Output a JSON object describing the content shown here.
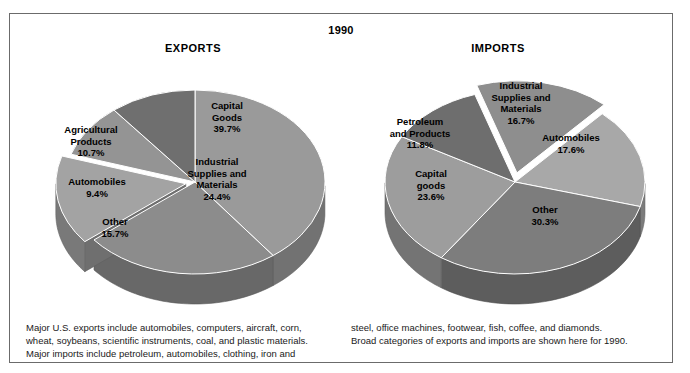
{
  "figure": {
    "year_title": "1990",
    "headings": {
      "exports": "EXPORTS",
      "imports": "IMPORTS"
    },
    "border_color": "#6b6b6b",
    "background": "#ffffff"
  },
  "caption": {
    "left_lines": [
      "Major U.S. exports include automobiles, computers, aircraft, corn,",
      "wheat, soybeans, scientific instruments, coal, and plastic materials.",
      "Major imports include petroleum, automobiles, clothing, iron and"
    ],
    "right_lines": [
      "steel, office machines, footwear, fish, coffee, and diamonds.",
      "Broad categories of exports and imports are shown here for 1990."
    ]
  },
  "chart_data": [
    {
      "type": "pie",
      "title": "EXPORTS",
      "subtitle": "1990",
      "xlabel": "",
      "ylabel": "",
      "grid": false,
      "legend": "none",
      "style": "3d-exploded",
      "units": "percent",
      "categories": [
        "Capital Goods",
        "Industrial Supplies and Materials",
        "Other",
        "Automobiles",
        "Agricultural Products"
      ],
      "values": [
        39.7,
        24.4,
        15.7,
        9.4,
        10.7
      ],
      "labels": [
        {
          "name": "Capital Goods",
          "name_lines": [
            "Capital",
            "Goods"
          ],
          "value": 39.7,
          "pct_text": "39.7%",
          "color": "#9a9a9a",
          "exploded": false
        },
        {
          "name": "Industrial Supplies and Materials",
          "name_lines": [
            "Industrial",
            "Supplies and",
            "Materials"
          ],
          "value": 24.4,
          "pct_text": "24.4%",
          "color": "#8c8c8c",
          "exploded": false
        },
        {
          "name": "Other",
          "name_lines": [
            "Other"
          ],
          "value": 15.7,
          "pct_text": "15.7%",
          "color": "#a3a3a3",
          "exploded": true
        },
        {
          "name": "Automobiles",
          "name_lines": [
            "Automobiles"
          ],
          "value": 9.4,
          "pct_text": "9.4%",
          "color": "#949494",
          "exploded": false
        },
        {
          "name": "Agricultural Products",
          "name_lines": [
            "Agricultural",
            "Products"
          ],
          "value": 10.7,
          "pct_text": "10.7%",
          "color": "#6f6f6f",
          "exploded": false
        }
      ]
    },
    {
      "type": "pie",
      "title": "IMPORTS",
      "subtitle": "1990",
      "xlabel": "",
      "ylabel": "",
      "grid": false,
      "legend": "none",
      "style": "3d-exploded",
      "units": "percent",
      "categories": [
        "Industrial Supplies and Materials",
        "Automobiles",
        "Other",
        "Capital goods",
        "Petroleum and Products"
      ],
      "values": [
        16.7,
        17.6,
        30.3,
        23.6,
        11.8
      ],
      "labels": [
        {
          "name": "Industrial Supplies and Materials",
          "name_lines": [
            "Industrial",
            "Supplies and",
            "Materials"
          ],
          "value": 16.7,
          "pct_text": "16.7%",
          "color": "#8e8e8e",
          "exploded": true
        },
        {
          "name": "Automobiles",
          "name_lines": [
            "Automobiles"
          ],
          "value": 17.6,
          "pct_text": "17.6%",
          "color": "#a8a8a8",
          "exploded": false
        },
        {
          "name": "Other",
          "name_lines": [
            "Other"
          ],
          "value": 30.3,
          "pct_text": "30.3%",
          "color": "#7d7d7d",
          "exploded": false
        },
        {
          "name": "Capital goods",
          "name_lines": [
            "Capital",
            "goods"
          ],
          "value": 23.6,
          "pct_text": "23.6%",
          "color": "#9d9d9d",
          "exploded": false
        },
        {
          "name": "Petroleum and Products",
          "name_lines": [
            "Petroleum",
            "and Products"
          ],
          "value": 11.8,
          "pct_text": "11.8%",
          "color": "#6e6e6e",
          "exploded": false
        }
      ]
    }
  ]
}
